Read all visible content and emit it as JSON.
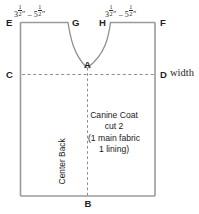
{
  "diagram": {
    "background_color": "#ffffff",
    "outline_color": "#9a9a9a",
    "dash_color": "#8c8c8c",
    "text_color": "#1a1a1a"
  },
  "dimensions": {
    "left_shoulder": {
      "whole_a": "3",
      "frac_a_num": "1",
      "frac_a_den": "2",
      "inch_a": "″",
      "dash": "–",
      "whole_b": "5",
      "frac_b_num": "1",
      "frac_b_den": "2",
      "inch_b": "″"
    },
    "right_shoulder": {
      "whole_a": "3",
      "frac_a_num": "1",
      "frac_a_den": "2",
      "inch_a": "″",
      "dash": "–",
      "whole_b": "5",
      "frac_b_num": "1",
      "frac_b_den": "2",
      "inch_b": "″"
    }
  },
  "points": {
    "a": "A",
    "b": "B",
    "c": "C",
    "d": "D",
    "e": "E",
    "f": "F",
    "g": "G",
    "h": "H"
  },
  "annotations": {
    "width": "width",
    "center_back": "Center Back"
  },
  "piece_text": {
    "line1": "Canine Coat",
    "line2": "cut 2",
    "line3": "(1 main fabric",
    "line4": "1 lining)"
  }
}
